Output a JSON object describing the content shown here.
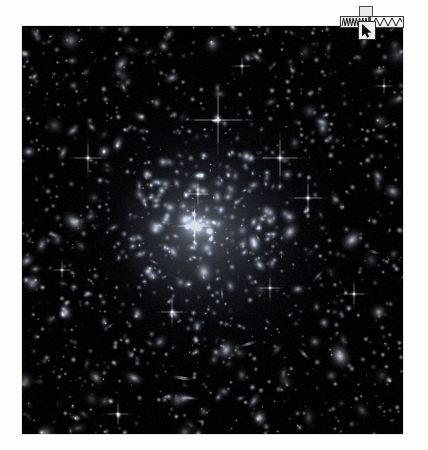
{
  "page": {
    "background_color": "#fdfdfd"
  },
  "plate": {
    "name": "galaxy-cluster-deep-field",
    "alt_text": "Deep field photograph of a massive galaxy cluster",
    "background_color": "#020203",
    "frame_color": "#e6e6e6",
    "x": 22,
    "y": 26,
    "width": 381,
    "height": 408,
    "core_glow_color": "#b9c3d7",
    "star_color": "#ffffff"
  },
  "widget": {
    "name": "overlay-toolbar",
    "mini_label_text": "",
    "wave_strip": {
      "name": "waveform-strip",
      "background_color": "#f2f2f0",
      "stroke_color": "#1c1c1c",
      "dense_segment_cycles": 9,
      "sparse_segment_cycles": 4
    },
    "cursor_button": {
      "name": "pointer-tool-button",
      "icon": "cursor-arrow-icon",
      "background_color": "#efefee",
      "icon_color": "#101010"
    }
  }
}
